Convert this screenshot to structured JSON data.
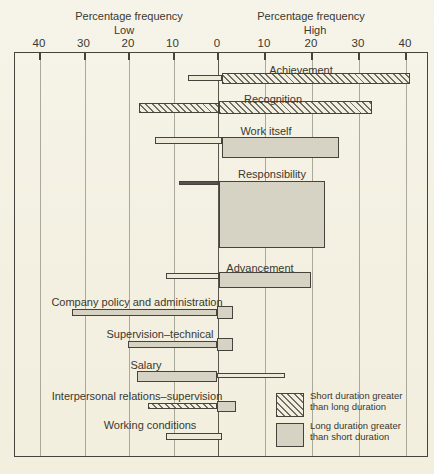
{
  "header": {
    "left": {
      "title": "Percentage frequency",
      "subtitle": "Low"
    },
    "right": {
      "title": "Percentage frequency",
      "subtitle": "High"
    }
  },
  "legend": {
    "items": [
      {
        "swatch": "hatched",
        "label": "Short duration greater than long duration"
      },
      {
        "swatch": "gray",
        "label": "Long duration greater than short duration"
      }
    ]
  },
  "colors": {
    "paper": "#f3f0e1",
    "bar_gray_fill": "#d6d3c4",
    "line": "#45433c",
    "gridline": "#aaa89a",
    "text": "#3a382f"
  },
  "chart_data": {
    "type": "bar",
    "variant": "diverging-horizontal",
    "xlabel": "Percentage frequency",
    "axis": {
      "left_label": "Percentage frequency",
      "left_sublabel": "Low",
      "right_label": "Percentage frequency",
      "right_sublabel": "High",
      "tick_values": [
        -40,
        -30,
        -20,
        -10,
        0,
        10,
        20,
        30,
        40
      ],
      "tick_labels": [
        "40",
        "30",
        "20",
        "10",
        "0",
        "10",
        "20",
        "30",
        "40"
      ],
      "xlim": [
        -45,
        45
      ],
      "grid": true
    },
    "legend_note": {
      "hatched": "Short duration greater than long duration",
      "gray": "Long duration greater than short duration"
    },
    "factors": [
      {
        "label": "Achievement",
        "low_pct": 7,
        "high_pct": 41,
        "label_pos": {
          "x": 301,
          "y": 64
        },
        "segments": [
          {
            "from": -6.5,
            "to": 1,
            "style": "outline",
            "top": 75,
            "h": 6
          },
          {
            "from": 1,
            "to": 41,
            "style": "hatched",
            "top": 73,
            "h": 11
          }
        ]
      },
      {
        "label": "Recognition",
        "low_pct": 18,
        "high_pct": 33,
        "label_pos": {
          "x": 273,
          "y": 93
        },
        "segments": [
          {
            "from": -17.5,
            "to": 0.5,
            "style": "hatched",
            "top": 103,
            "h": 10
          },
          {
            "from": 0.5,
            "to": 33,
            "style": "hatched",
            "top": 101,
            "h": 13
          }
        ]
      },
      {
        "label": "Work itself",
        "low_pct": 14,
        "high_pct": 26,
        "label_pos": {
          "x": 266,
          "y": 125
        },
        "segments": [
          {
            "from": -14,
            "to": 1,
            "style": "outline",
            "top": 137,
            "h": 7
          },
          {
            "from": 1,
            "to": 26,
            "style": "gray",
            "top": 137,
            "h": 21
          }
        ]
      },
      {
        "label": "Responsibility",
        "low_pct": 6,
        "high_pct": 23,
        "label_pos": {
          "x": 272,
          "y": 168
        },
        "segments": [
          {
            "from": -8.5,
            "to": 0.5,
            "style": "dark",
            "top": 181,
            "h": 4
          },
          {
            "from": 0.5,
            "to": 23,
            "style": "gray",
            "top": 181,
            "h": 67
          }
        ]
      },
      {
        "label": "Advancement",
        "low_pct": 11,
        "high_pct": 20,
        "label_pos": {
          "x": 260,
          "y": 262
        },
        "segments": [
          {
            "from": -11.5,
            "to": 0.5,
            "style": "outline",
            "top": 273,
            "h": 6
          },
          {
            "from": 0.5,
            "to": 20,
            "style": "gray",
            "top": 272,
            "h": 16
          }
        ]
      },
      {
        "label": "Company policy and administration",
        "low_pct": 31,
        "high_pct": 3,
        "label_pos": {
          "x": 137,
          "y": 296
        },
        "segments": [
          {
            "from": -32.5,
            "to": 0,
            "style": "gray",
            "top": 309,
            "h": 7
          },
          {
            "from": 0,
            "to": 3.5,
            "style": "gray",
            "top": 306,
            "h": 13
          }
        ]
      },
      {
        "label": "Supervision–technical",
        "low_pct": 20,
        "high_pct": 3,
        "label_pos": {
          "x": 160,
          "y": 328
        },
        "segments": [
          {
            "from": -20,
            "to": 0,
            "style": "gray",
            "top": 341,
            "h": 7
          },
          {
            "from": 0,
            "to": 3.5,
            "style": "gray",
            "top": 338,
            "h": 13
          }
        ]
      },
      {
        "label": "Salary",
        "low_pct": 17,
        "high_pct": 15,
        "label_pos": {
          "x": 146,
          "y": 359
        },
        "segments": [
          {
            "from": -18,
            "to": 0,
            "style": "gray",
            "top": 371,
            "h": 11
          },
          {
            "from": 0,
            "to": 14.5,
            "style": "outline",
            "top": 373,
            "h": 5
          }
        ]
      },
      {
        "label": "Interpersonal relations–supervision",
        "low_pct": 15,
        "high_pct": 4,
        "label_pos": {
          "x": 137,
          "y": 390
        },
        "segments": [
          {
            "from": -15.5,
            "to": 0,
            "style": "hatched",
            "top": 403,
            "h": 6
          },
          {
            "from": 0,
            "to": 4,
            "style": "gray",
            "top": 401,
            "h": 11
          }
        ]
      },
      {
        "label": "Working conditions",
        "low_pct": 11,
        "high_pct": 1,
        "label_pos": {
          "x": 150,
          "y": 419
        },
        "segments": [
          {
            "from": -11.5,
            "to": 1,
            "style": "outline",
            "top": 433,
            "h": 7
          }
        ]
      }
    ]
  }
}
